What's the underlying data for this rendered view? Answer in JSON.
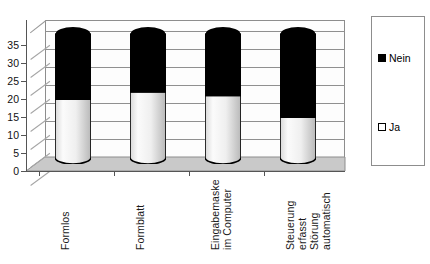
{
  "chart_data": {
    "type": "bar",
    "subtype": "stacked-cylinder-3d",
    "title": "",
    "subtitle": "",
    "xlabel": "",
    "ylabel": "",
    "ylim": [
      0,
      38
    ],
    "y_ticks": [
      0,
      5,
      10,
      15,
      20,
      25,
      30,
      35
    ],
    "grid": true,
    "legend_position": "right",
    "categories": [
      "Formlos",
      "Formblatt",
      "Eingabemaske im Computer",
      "Steuerung erfasst Störung automatisch"
    ],
    "category_lines": [
      [
        "Formlos"
      ],
      [
        "Formblatt"
      ],
      [
        "Eingabemaske",
        "im Computer"
      ],
      [
        "Steuerung",
        "erfasst",
        "Störung",
        "automatisch"
      ]
    ],
    "series": [
      {
        "name": "Ja",
        "color": "#f2f2f2",
        "values": [
          18,
          20,
          19,
          13
        ]
      },
      {
        "name": "Nein",
        "color": "#000000",
        "values": [
          20,
          18,
          19,
          25
        ]
      }
    ],
    "totals": [
      38,
      38,
      38,
      38
    ],
    "legend_entries": [
      {
        "label": "Nein",
        "color": "#000000"
      },
      {
        "label": "Ja",
        "color": "#ffffff"
      }
    ]
  },
  "axis": {
    "y_tick_labels": [
      "0",
      "5",
      "10",
      "15",
      "20",
      "25",
      "30",
      "35"
    ]
  },
  "legend": {
    "nein_label": "Nein",
    "ja_label": "Ja"
  },
  "categories": {
    "c0_l0": "Formlos",
    "c1_l0": "Formblatt",
    "c2_l0": "Eingabemaske",
    "c2_l1": "im Computer",
    "c3_l0": "Steuerung",
    "c3_l1": "erfasst",
    "c3_l2": "Störung",
    "c3_l3": "automatisch"
  },
  "colors": {
    "nein": "#000000",
    "ja": "#f2f2f2",
    "floor": "#c9c9c9",
    "wall": "#fdfdfd",
    "grid": "#909090",
    "axis": "#555555"
  }
}
